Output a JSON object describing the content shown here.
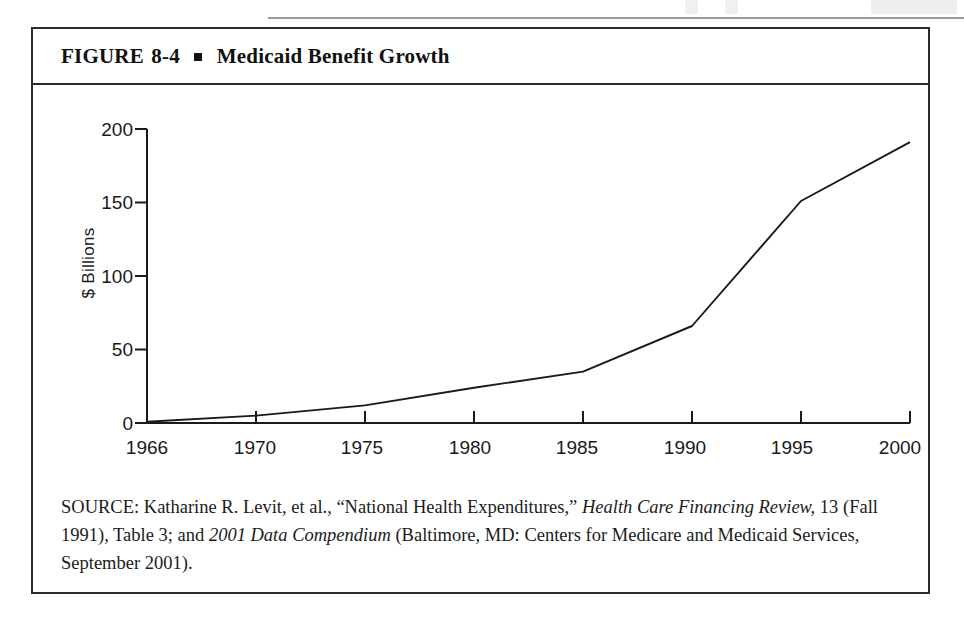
{
  "figure": {
    "title_prefix": "FIGURE",
    "title_number": "8-4",
    "title_text": "Medicaid Benefit Growth",
    "bullet_icon": "square-bullet-icon"
  },
  "chart_data": {
    "type": "line",
    "title": "Medicaid Benefit Growth",
    "xlabel": "",
    "ylabel": "$ Billions",
    "categories": [
      "1966",
      "1970",
      "1975",
      "1980",
      "1985",
      "1990",
      "1995",
      "2000"
    ],
    "values": [
      0.8,
      5,
      12,
      24,
      35,
      66,
      151,
      191
    ],
    "ylim": [
      0,
      200
    ],
    "yticks": [
      0,
      50,
      100,
      150,
      200
    ],
    "ytick_labels": [
      "0",
      "50",
      "100",
      "150",
      "200"
    ],
    "xtick_labels": [
      "1966",
      "1970",
      "1975",
      "1980",
      "1985",
      "1990",
      "1995",
      "2000"
    ],
    "grid": false,
    "legend": null,
    "series": [
      {
        "name": "Medicaid benefit payments",
        "values": [
          0.8,
          5,
          12,
          24,
          35,
          66,
          151,
          191
        ]
      }
    ],
    "line_color": "#1a1a1a",
    "axis_color": "#1a1a1a"
  },
  "source": {
    "label": "SOURCE:",
    "line_1_a": " Katharine R. Levit, et al., “National Health Expenditures,” ",
    "italic_1": "Health Care Financing Review,",
    "line_2_a": " 13 (Fall 1991), Table 3; and ",
    "italic_2": "2001 Data Compendium",
    "line_2_b": " (Baltimore, MD: Centers for Medicare and Medicaid Services, September 2001)."
  },
  "colors": {
    "frame": "#2b2b2b",
    "ink": "#111111",
    "line": "#1a1a1a"
  }
}
